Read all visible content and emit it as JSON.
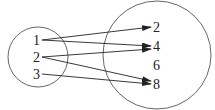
{
  "diagram": {
    "type": "mapping",
    "domain_set": {
      "elements": [
        "1",
        "2",
        "3"
      ],
      "circle": {
        "cx": 38,
        "cy": 57,
        "r": 30
      }
    },
    "codomain_set": {
      "elements": [
        "2",
        "4",
        "6",
        "8"
      ],
      "circle": {
        "cx": 157,
        "cy": 55,
        "r": 54
      }
    },
    "mappings": [
      {
        "from": "1",
        "to": "2"
      },
      {
        "from": "1",
        "to": "4"
      },
      {
        "from": "2",
        "to": "4"
      },
      {
        "from": "2",
        "to": "8"
      },
      {
        "from": "3",
        "to": "8"
      }
    ],
    "colors": {
      "stroke": "#333333",
      "text": "#222222",
      "background": "#ffffff"
    }
  }
}
